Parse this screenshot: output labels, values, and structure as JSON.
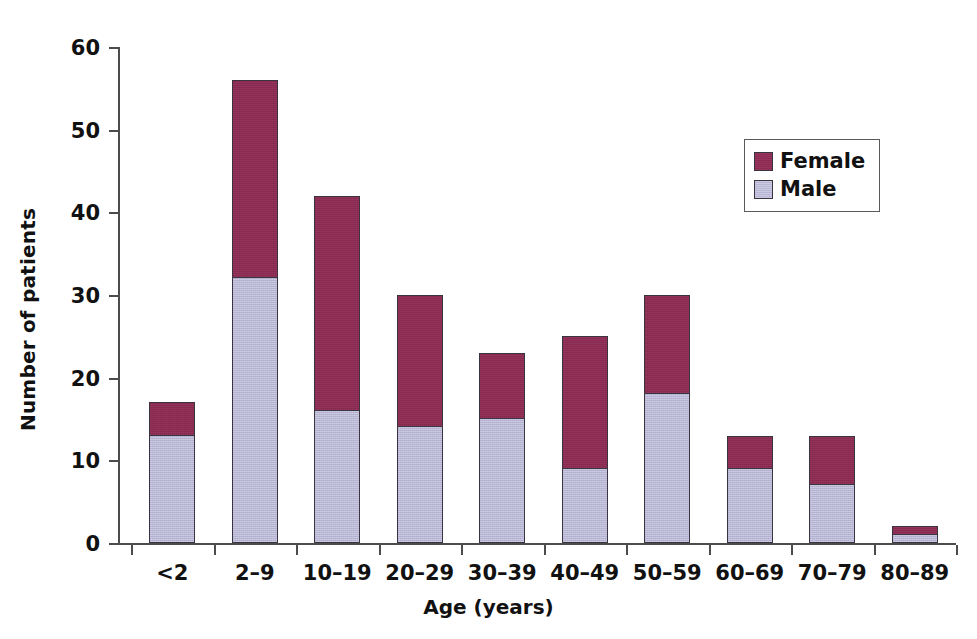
{
  "chart_data": {
    "type": "bar",
    "stacked": true,
    "title": "",
    "xlabel": "Age (years)",
    "ylabel": "Number of patients",
    "categories": [
      "<2",
      "2–9",
      "10–19",
      "20–29",
      "30–39",
      "40–49",
      "50–59",
      "60–69",
      "70–79",
      "80–89"
    ],
    "series": [
      {
        "name": "Female",
        "color": "#8e2a52",
        "values": [
          4,
          24,
          26,
          16,
          8,
          16,
          12,
          4,
          6,
          1
        ]
      },
      {
        "name": "Male",
        "color": "#b7b6d6",
        "values": [
          13,
          32,
          16,
          14,
          15,
          9,
          18,
          9,
          7,
          1
        ]
      }
    ],
    "totals": [
      17,
      56,
      42,
      30,
      23,
      25,
      30,
      13,
      13,
      2
    ],
    "ylim": [
      0,
      60
    ],
    "yticks": [
      0,
      10,
      20,
      30,
      40,
      50,
      60
    ],
    "ytick_labels": [
      "0",
      "10",
      "20",
      "30",
      "40",
      "50",
      "60"
    ],
    "grid": false,
    "legend_position": "upper-right",
    "legend_entries": [
      "Female",
      "Male"
    ]
  },
  "legend": {
    "female_label": "Female",
    "male_label": "Male"
  },
  "axes": {
    "x_title": "Age (years)",
    "y_title": "Number of patients"
  }
}
